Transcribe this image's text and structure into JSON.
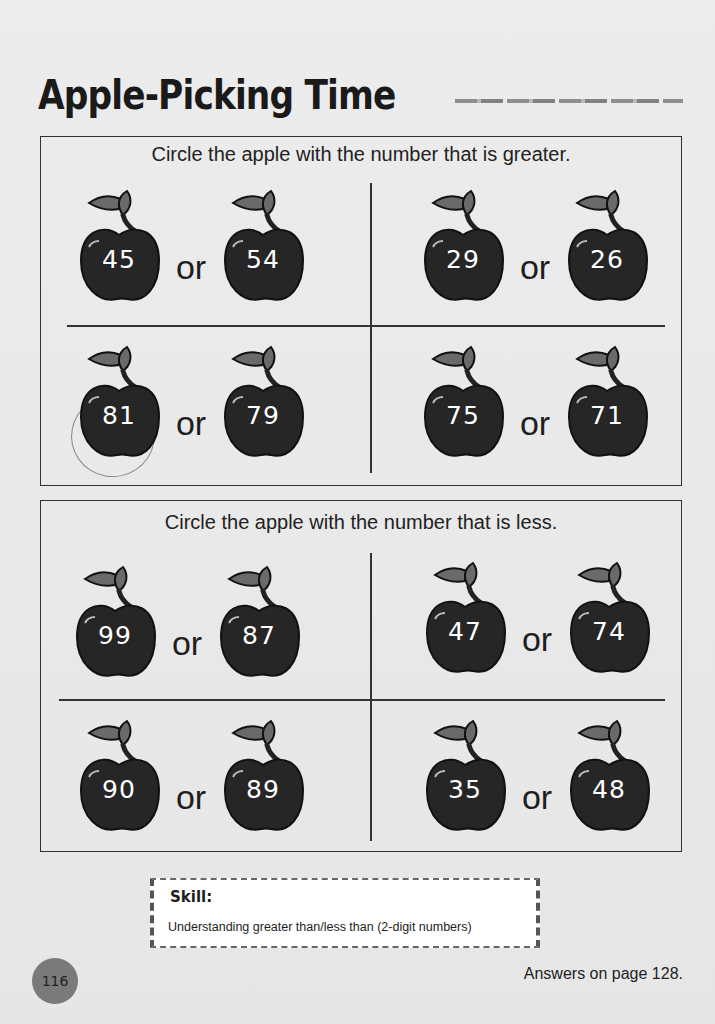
{
  "title": "Apple-Picking Time",
  "sections": [
    {
      "instruction": "Circle the apple with the number that is greater.",
      "pairs": [
        {
          "left": "45",
          "right": "54"
        },
        {
          "left": "29",
          "right": "26"
        },
        {
          "left": "81",
          "right": "79"
        },
        {
          "left": "75",
          "right": "71"
        }
      ]
    },
    {
      "instruction": "Circle the apple with the number that is less.",
      "pairs": [
        {
          "left": "99",
          "right": "87"
        },
        {
          "left": "47",
          "right": "74"
        },
        {
          "left": "90",
          "right": "89"
        },
        {
          "left": "35",
          "right": "48"
        }
      ]
    }
  ],
  "connector": "or",
  "skill": {
    "label": "Skill:",
    "text": "Understanding greater than/less than (2-digit numbers)"
  },
  "page_number": "116",
  "answers_note": "Answers on page 128."
}
